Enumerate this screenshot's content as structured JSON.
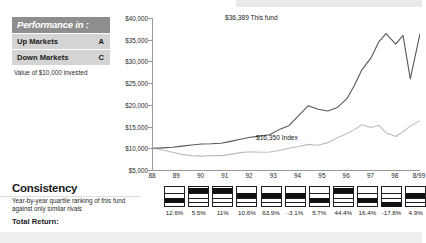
{
  "performance_panel": {
    "header": "Performance in :",
    "rows": [
      {
        "label": "Up Markets",
        "grade": "A"
      },
      {
        "label": "Down Markets",
        "grade": "C"
      }
    ],
    "note": "Value of $10,000 invested"
  },
  "consistency": {
    "title": "Consistency",
    "description": "Year-by-year quartile ranking of this fund against only similar rivals",
    "total_return_label": "Total Return:"
  },
  "annotations": {
    "fund": "$36,389 This fund",
    "index": "$16,350 Index"
  },
  "chart_data": {
    "type": "line",
    "title": "Value of $10,000 invested",
    "xlabel": "",
    "ylabel": "",
    "ylim": [
      5000,
      40000
    ],
    "yticks": [
      40000,
      35000,
      30000,
      25000,
      20000,
      15000,
      10000,
      5000
    ],
    "ytick_labels": [
      "$40,000",
      "$35,000",
      "$30,000",
      "$25,000",
      "$20,000",
      "$15,000",
      "$10,000",
      "$5,000"
    ],
    "grid": false,
    "legend": "annotations",
    "x_tick_labels": [
      "88",
      "89",
      "90",
      "91",
      "92",
      "93",
      "94",
      "95",
      "96",
      "97",
      "98",
      "8/99"
    ],
    "x_tick_values": [
      88,
      89,
      90,
      91,
      92,
      93,
      94,
      95,
      96,
      97,
      98,
      99
    ],
    "series": [
      {
        "name": "This fund",
        "color": "#555555",
        "end_value": 36389,
        "end_label": "$36,389 This fund",
        "x": [
          88.0,
          88.4,
          88.8,
          89.2,
          89.6,
          90.0,
          90.4,
          90.8,
          91.2,
          91.6,
          92.0,
          92.4,
          92.8,
          93.2,
          93.6,
          94.0,
          94.4,
          94.8,
          95.2,
          95.6,
          96.0,
          96.3,
          96.6,
          97.0,
          97.3,
          97.6,
          98.0,
          98.3,
          98.6,
          99.0
        ],
        "y": [
          10000,
          10100,
          10250,
          10500,
          10750,
          11000,
          11050,
          11150,
          11600,
          12100,
          12550,
          12800,
          13100,
          14300,
          15200,
          17500,
          19800,
          19000,
          18600,
          19400,
          21500,
          24500,
          28000,
          31000,
          34500,
          36389,
          34000,
          36000,
          26000,
          36389
        ]
      },
      {
        "name": "Index",
        "color": "#b9b9b9",
        "end_value": 16350,
        "end_label": "$16,350 Index",
        "x": [
          88.0,
          88.4,
          88.8,
          89.2,
          89.6,
          90.0,
          90.4,
          90.8,
          91.2,
          91.6,
          92.0,
          92.4,
          92.8,
          93.2,
          93.6,
          94.0,
          94.4,
          94.8,
          95.2,
          95.6,
          96.0,
          96.3,
          96.6,
          97.0,
          97.3,
          97.6,
          98.0,
          98.3,
          98.6,
          99.0
        ],
        "y": [
          10000,
          9600,
          9100,
          8600,
          8300,
          8200,
          8350,
          8300,
          8600,
          9000,
          9200,
          9100,
          9150,
          9500,
          10000,
          10400,
          10900,
          10700,
          11300,
          12400,
          13400,
          14300,
          15400,
          14800,
          15300,
          13600,
          12700,
          13800,
          15100,
          16350
        ]
      }
    ],
    "quartile_ranking": {
      "years": [
        "88",
        "89",
        "90",
        "91",
        "92",
        "93",
        "94",
        "95",
        "96",
        "97",
        "98",
        "8/99"
      ],
      "quartiles": [
        null,
        3,
        1,
        1,
        2,
        2,
        2,
        3,
        1,
        3,
        4,
        2
      ],
      "returns": [
        "",
        "12.6%",
        "5.5%",
        "11%",
        "10.6%",
        "63.9%",
        "-3.1%",
        "5.7%",
        "44.4%",
        "16.4%",
        "-17.8%",
        "4.9%"
      ]
    }
  }
}
